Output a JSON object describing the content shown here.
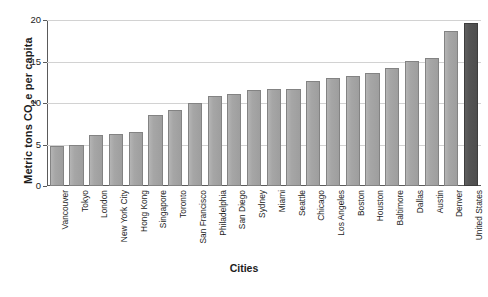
{
  "chart_data": {
    "type": "bar",
    "title": "",
    "xlabel": "Cities",
    "ylabel": "Metric tons CO2e per capita",
    "ylabel_html": "Metric tons CO<sub>2</sub>e per capita",
    "ylim": [
      0,
      20
    ],
    "yticks": [
      0,
      5,
      10,
      15,
      20
    ],
    "ytick_labels": [
      "0",
      "5",
      "10",
      "15",
      "20"
    ],
    "grid": "horizontal",
    "legend": "none",
    "categories": [
      "Vancouver",
      "Tokyo",
      "London",
      "New York City",
      "Hong Kong",
      "Singapore",
      "Toronto",
      "San Francisco",
      "Philadelphia",
      "San Diego",
      "Sydney",
      "Miami",
      "Seattle",
      "Chicago",
      "Los Angeles",
      "Boston",
      "Houston",
      "Baltimore",
      "Dallas",
      "Austin",
      "Denver",
      "United States"
    ],
    "values": [
      4.8,
      4.9,
      6.1,
      6.3,
      6.5,
      8.6,
      9.2,
      10.0,
      10.9,
      11.1,
      11.6,
      11.7,
      11.7,
      12.6,
      13.0,
      13.2,
      13.6,
      14.2,
      15.1,
      15.4,
      18.7,
      19.6
    ],
    "highlight_category": "United States",
    "colors": {
      "bar": "#a6a6a6",
      "bar_edge": "#838383",
      "highlight_bar": "#545454",
      "highlight_bar_edge": "#3d3d3d",
      "gridline": "#d2d2d2",
      "axis": "#5a5a5a",
      "text": "#1c1c1c",
      "background": "#ffffff"
    }
  }
}
